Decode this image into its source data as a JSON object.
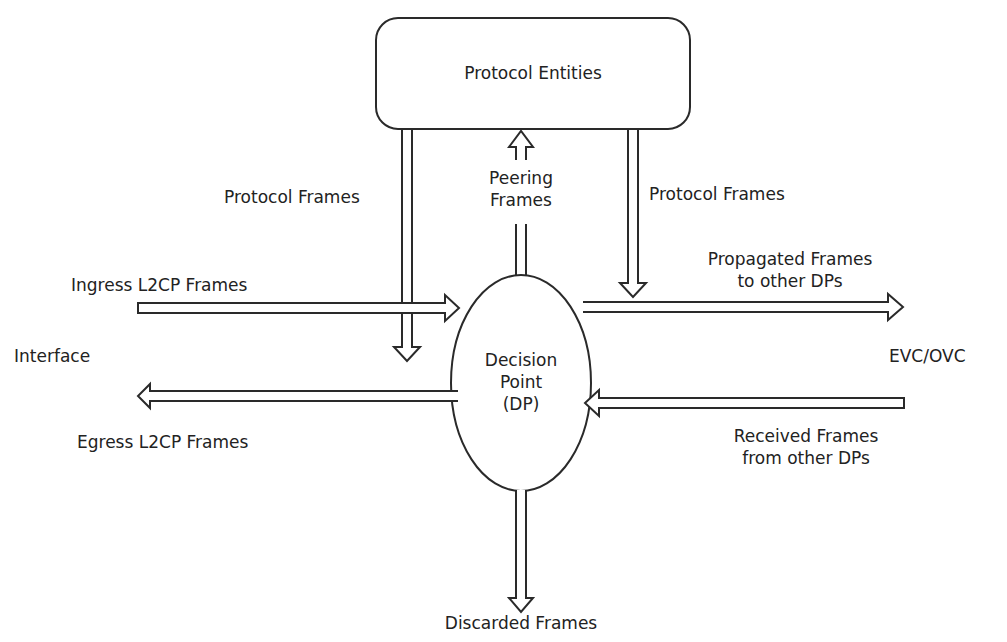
{
  "diagram": {
    "nodes": {
      "protocol_entities": "Protocol Entities",
      "decision_point": [
        "Decision",
        "Point",
        "(DP)"
      ]
    },
    "labels": {
      "protocol_frames_left": "Protocol Frames",
      "protocol_frames_right": "Protocol Frames",
      "peering_frames": [
        "Peering",
        "Frames"
      ],
      "ingress": "Ingress L2CP Frames",
      "egress": "Egress L2CP Frames",
      "interface": "Interface",
      "evc_ovc": "EVC/OVC",
      "propagated": [
        "Propagated Frames",
        "to other DPs"
      ],
      "received": [
        "Received Frames",
        "from other DPs"
      ],
      "discarded": "Discarded Frames"
    },
    "colors": {
      "stroke": "#2a2a2a",
      "fill": "#ffffff"
    }
  }
}
